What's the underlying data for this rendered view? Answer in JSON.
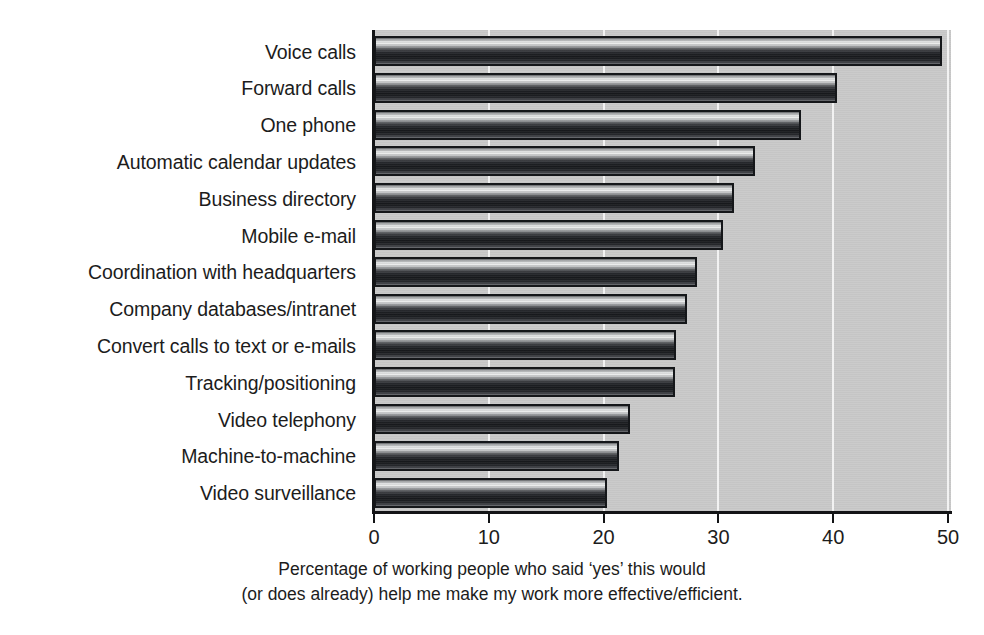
{
  "chart_data": {
    "type": "bar",
    "orientation": "horizontal",
    "title": "",
    "subtitle": "",
    "xlabel": "Percentage of working people who said ‘yes’ this would (or does already) help me make my work more effective/efficient.",
    "ylabel": "",
    "xlim": [
      0,
      50
    ],
    "xticks": [
      0,
      10,
      20,
      30,
      40,
      50
    ],
    "xtick_labels": [
      "0",
      "10",
      "20",
      "30",
      "40",
      "50"
    ],
    "grid": true,
    "grid_axis": "x",
    "legend": false,
    "legend_position": "none",
    "categories": [
      "Voice calls",
      "Forward calls",
      "One phone",
      "Automatic calendar updates",
      "Business directory",
      "Mobile e-mail",
      "Coordination with headquarters",
      "Company databases/intranet",
      "Convert calls to text or e-mails",
      "Tracking/positioning",
      "Video telephony",
      "Machine-to-machine",
      "Video surveillance"
    ],
    "values": [
      49.5,
      40.3,
      37.2,
      33.2,
      31.4,
      30.4,
      28.1,
      27.3,
      26.3,
      26.2,
      22.3,
      21.3,
      20.3
    ],
    "series": [
      {
        "name": "Percentage of working people",
        "values": [
          49.5,
          40.3,
          37.2,
          33.2,
          31.4,
          30.4,
          28.1,
          27.3,
          26.3,
          26.2,
          22.3,
          21.3,
          20.3
        ]
      }
    ]
  },
  "caption": {
    "line1": "Percentage of working people who said ‘yes’ this would",
    "line2": "(or does already) help me make my work more effective/efficient."
  },
  "colors": {
    "plot_background": "#c9c9c9",
    "gridline": "#f2f2f2",
    "axis": "#131416",
    "bar_outline": "#15171a",
    "bar_fill_light": "#f0f1f1",
    "bar_fill_dark": "#17191c",
    "page_background": "#ffffff",
    "text": "#1c1c1c"
  }
}
